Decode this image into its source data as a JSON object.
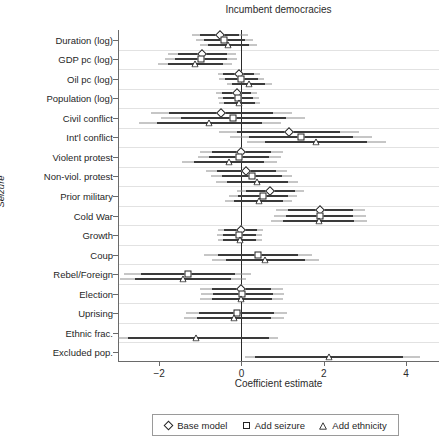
{
  "chart_data": {
    "type": "scatter",
    "title": "Incumbent democracies",
    "xlabel": "Coefficient estimate",
    "ylabel": "Seizure",
    "xlim": [
      -3.0,
      4.8
    ],
    "xticks": [
      -2,
      0,
      2,
      4
    ],
    "xtick_labels": [
      "−2",
      "0",
      "2",
      "4"
    ],
    "grid": true,
    "zero_reference_line": 0,
    "legend_position": "bottom",
    "legend": [
      {
        "name": "Base model",
        "marker": "diamond"
      },
      {
        "name": "Add seizure",
        "marker": "square"
      },
      {
        "name": "Add ethnicity",
        "marker": "triangle"
      }
    ],
    "categories": [
      "Duration (log)",
      "GDP pc (log)",
      "Oil pc (log)",
      "Population (log)",
      "Civil conflict",
      "Int'l conflict",
      "Violent protest",
      "Non-viol. protest",
      "Prior military",
      "Cold War",
      "Growth",
      "Coup",
      "Rebel/Foreign",
      "Election",
      "Uprising",
      "Ethnic frac.",
      "Excluded pop."
    ],
    "series": [
      {
        "name": "Base model",
        "marker": "diamond",
        "points": [
          {
            "category": "Duration (log)",
            "estimate": -0.52,
            "ci_low": -1.0,
            "ci_high": -0.05,
            "ci_outer_low": -1.2,
            "ci_outer_high": 0.15
          },
          {
            "category": "GDP pc (log)",
            "estimate": -0.95,
            "ci_low": -1.55,
            "ci_high": -0.36,
            "ci_outer_low": -1.78,
            "ci_outer_high": -0.14
          },
          {
            "category": "Oil pc (log)",
            "estimate": -0.07,
            "ci_low": -0.44,
            "ci_high": 0.3,
            "ci_outer_low": -0.58,
            "ci_outer_high": 0.45
          },
          {
            "category": "Population (log)",
            "estimate": -0.12,
            "ci_low": -0.48,
            "ci_high": 0.24,
            "ci_outer_low": -0.62,
            "ci_outer_high": 0.38
          },
          {
            "category": "Civil conflict",
            "estimate": -0.5,
            "ci_low": -1.75,
            "ci_high": 0.76,
            "ci_outer_low": -2.2,
            "ci_outer_high": 1.22
          },
          {
            "category": "Int'l conflict",
            "estimate": 1.15,
            "ci_low": -0.1,
            "ci_high": 2.4,
            "ci_outer_low": -0.55,
            "ci_outer_high": 2.85
          },
          {
            "category": "Violent protest",
            "estimate": 0.0,
            "ci_low": -0.72,
            "ci_high": 0.72,
            "ci_outer_low": -1.0,
            "ci_outer_high": 1.0
          },
          {
            "category": "Non-viol. protest",
            "estimate": 0.12,
            "ci_low": -0.6,
            "ci_high": 0.85,
            "ci_outer_low": -0.86,
            "ci_outer_high": 1.1
          },
          {
            "category": "Prior military",
            "estimate": 0.7,
            "ci_low": 0.1,
            "ci_high": 1.3,
            "ci_outer_low": -0.12,
            "ci_outer_high": 1.52
          },
          {
            "category": "Cold War",
            "estimate": 1.92,
            "ci_low": 1.12,
            "ci_high": 2.72,
            "ci_outer_low": 0.85,
            "ci_outer_high": 3.0
          },
          {
            "category": "Growth",
            "estimate": -0.02,
            "ci_low": -0.42,
            "ci_high": 0.38,
            "ci_outer_low": -0.56,
            "ci_outer_high": 0.52
          },
          {
            "category": "Election",
            "estimate": 0.0,
            "ci_low": -0.72,
            "ci_high": 0.72,
            "ci_outer_low": -1.0,
            "ci_outer_high": 1.0
          }
        ]
      },
      {
        "name": "Add seizure",
        "marker": "square",
        "points": [
          {
            "category": "Duration (log)",
            "estimate": -0.42,
            "ci_low": -0.92,
            "ci_high": 0.08,
            "ci_outer_low": -1.1,
            "ci_outer_high": 0.27
          },
          {
            "category": "GDP pc (log)",
            "estimate": -0.98,
            "ci_low": -1.62,
            "ci_high": -0.34,
            "ci_outer_low": -1.85,
            "ci_outer_high": -0.1
          },
          {
            "category": "Oil pc (log)",
            "estimate": 0.0,
            "ci_low": -0.4,
            "ci_high": 0.4,
            "ci_outer_low": -0.55,
            "ci_outer_high": 0.56
          },
          {
            "category": "Population (log)",
            "estimate": -0.08,
            "ci_low": -0.44,
            "ci_high": 0.28,
            "ci_outer_low": -0.58,
            "ci_outer_high": 0.42
          },
          {
            "category": "Civil conflict",
            "estimate": -0.2,
            "ci_low": -1.48,
            "ci_high": 1.08,
            "ci_outer_low": -1.95,
            "ci_outer_high": 1.55
          },
          {
            "category": "Int'l conflict",
            "estimate": 1.45,
            "ci_low": 0.18,
            "ci_high": 2.72,
            "ci_outer_low": -0.28,
            "ci_outer_high": 3.18
          },
          {
            "category": "Violent protest",
            "estimate": -0.05,
            "ci_low": -0.78,
            "ci_high": 0.68,
            "ci_outer_low": -1.05,
            "ci_outer_high": 0.95
          },
          {
            "category": "Non-viol. protest",
            "estimate": 0.25,
            "ci_low": -0.48,
            "ci_high": 0.98,
            "ci_outer_low": -0.74,
            "ci_outer_high": 1.24
          },
          {
            "category": "Prior military",
            "estimate": 0.52,
            "ci_low": -0.08,
            "ci_high": 1.12,
            "ci_outer_low": -0.3,
            "ci_outer_high": 1.34
          },
          {
            "category": "Cold War",
            "estimate": 1.9,
            "ci_low": 1.08,
            "ci_high": 2.72,
            "ci_outer_low": 0.8,
            "ci_outer_high": 3.02
          },
          {
            "category": "Growth",
            "estimate": -0.05,
            "ci_low": -0.45,
            "ci_high": 0.35,
            "ci_outer_low": -0.6,
            "ci_outer_high": 0.5
          },
          {
            "category": "Coup",
            "estimate": 0.4,
            "ci_low": -0.58,
            "ci_high": 1.38,
            "ci_outer_low": -0.92,
            "ci_outer_high": 1.72
          },
          {
            "category": "Rebel/Foreign",
            "estimate": -1.3,
            "ci_low": -2.45,
            "ci_high": -0.15,
            "ci_outer_low": -2.85,
            "ci_outer_high": 0.22
          },
          {
            "category": "Election",
            "estimate": 0.02,
            "ci_low": -0.7,
            "ci_high": 0.76,
            "ci_outer_low": -0.98,
            "ci_outer_high": 1.04
          },
          {
            "category": "Uprising",
            "estimate": -0.12,
            "ci_low": -1.02,
            "ci_high": 0.78,
            "ci_outer_low": -1.34,
            "ci_outer_high": 1.1
          }
        ]
      },
      {
        "name": "Add ethnicity",
        "marker": "triangle",
        "points": [
          {
            "category": "Duration (log)",
            "estimate": -0.32,
            "ci_low": -0.82,
            "ci_high": 0.18,
            "ci_outer_low": -1.0,
            "ci_outer_high": 0.38
          },
          {
            "category": "GDP pc (log)",
            "estimate": -1.12,
            "ci_low": -1.78,
            "ci_high": -0.46,
            "ci_outer_low": -2.02,
            "ci_outer_high": -0.22
          },
          {
            "category": "Oil pc (log)",
            "estimate": 0.18,
            "ci_low": -0.22,
            "ci_high": 0.58,
            "ci_outer_low": -0.36,
            "ci_outer_high": 0.74
          },
          {
            "category": "Population (log)",
            "estimate": -0.05,
            "ci_low": -0.42,
            "ci_high": 0.32,
            "ci_outer_low": -0.55,
            "ci_outer_high": 0.46
          },
          {
            "category": "Civil conflict",
            "estimate": -0.78,
            "ci_low": -2.05,
            "ci_high": 0.5,
            "ci_outer_low": -2.5,
            "ci_outer_high": 0.96
          },
          {
            "category": "Int'l conflict",
            "estimate": 1.82,
            "ci_low": 0.58,
            "ci_high": 3.06,
            "ci_outer_low": 0.14,
            "ci_outer_high": 3.52
          },
          {
            "category": "Violent protest",
            "estimate": -0.3,
            "ci_low": -1.15,
            "ci_high": 0.56,
            "ci_outer_low": -1.45,
            "ci_outer_high": 0.86
          },
          {
            "category": "Non-viol. protest",
            "estimate": 0.38,
            "ci_low": -0.36,
            "ci_high": 1.12,
            "ci_outer_low": -0.62,
            "ci_outer_high": 1.38
          },
          {
            "category": "Prior military",
            "estimate": 0.42,
            "ci_low": -0.18,
            "ci_high": 1.02,
            "ci_outer_low": -0.4,
            "ci_outer_high": 1.24
          },
          {
            "category": "Cold War",
            "estimate": 1.88,
            "ci_low": 1.02,
            "ci_high": 2.74,
            "ci_outer_low": 0.72,
            "ci_outer_high": 3.04
          },
          {
            "category": "Growth",
            "estimate": -0.04,
            "ci_low": -0.44,
            "ci_high": 0.36,
            "ci_outer_low": -0.58,
            "ci_outer_high": 0.5
          },
          {
            "category": "Coup",
            "estimate": 0.58,
            "ci_low": -0.38,
            "ci_high": 1.55,
            "ci_outer_low": -0.72,
            "ci_outer_high": 1.88
          },
          {
            "category": "Rebel/Foreign",
            "estimate": -1.42,
            "ci_low": -2.58,
            "ci_high": -0.26,
            "ci_outer_low": -2.96,
            "ci_outer_high": 0.1
          },
          {
            "category": "Election",
            "estimate": 0.0,
            "ci_low": -0.72,
            "ci_high": 0.74,
            "ci_outer_low": -1.0,
            "ci_outer_high": 1.02
          },
          {
            "category": "Uprising",
            "estimate": -0.18,
            "ci_low": -1.08,
            "ci_high": 0.72,
            "ci_outer_low": -1.4,
            "ci_outer_high": 1.04
          },
          {
            "category": "Ethnic frac.",
            "estimate": -1.1,
            "ci_low": -2.75,
            "ci_high": 0.66,
            "ci_outer_low": -3.0,
            "ci_outer_high": 0.88
          },
          {
            "category": "Excluded pop.",
            "estimate": 2.12,
            "ci_low": 0.32,
            "ci_high": 3.92,
            "ci_outer_low": 0.08,
            "ci_outer_high": 4.35
          }
        ]
      }
    ]
  }
}
